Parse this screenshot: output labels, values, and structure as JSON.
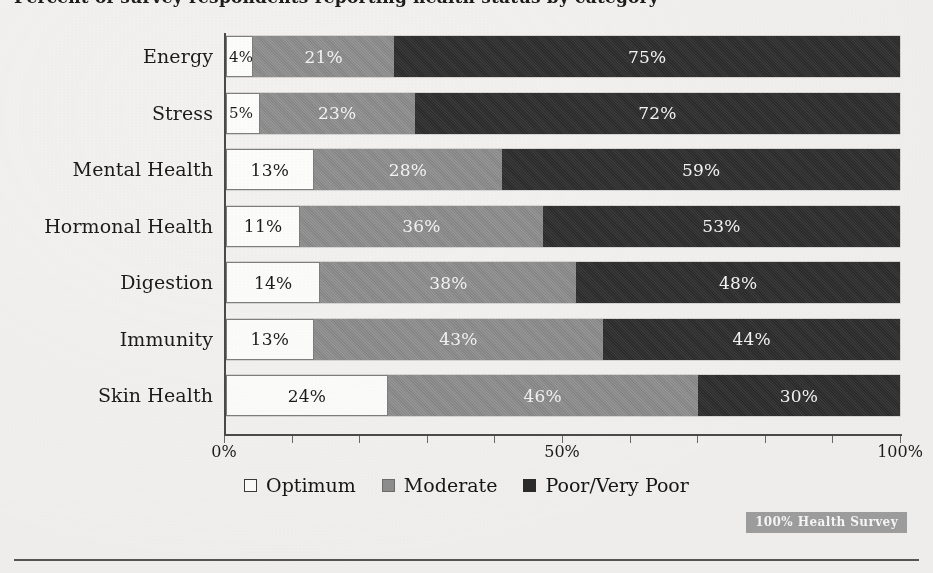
{
  "document": {
    "title_clipped": "Percent of survey respondents reporting health status by category",
    "background_color": "#f3f2f0"
  },
  "chart_data": {
    "type": "bar",
    "orientation": "horizontal",
    "stacked": true,
    "normalized_100": true,
    "title": "",
    "xlabel": "",
    "ylabel": "",
    "xlim": [
      0,
      100
    ],
    "grid": false,
    "legend_position": "bottom",
    "categories": [
      "Energy",
      "Stress",
      "Mental Health",
      "Hormonal Health",
      "Digestion",
      "Immunity",
      "Skin Health"
    ],
    "series": [
      {
        "name": "Optimum",
        "color": "#fdfdfb",
        "values": [
          4,
          5,
          13,
          11,
          14,
          13,
          24
        ],
        "labels": [
          "4%",
          "5%",
          "13%",
          "11%",
          "14%",
          "13%",
          "24%"
        ]
      },
      {
        "name": "Moderate",
        "color": "#8e8e8e",
        "values": [
          21,
          23,
          28,
          36,
          38,
          43,
          46
        ],
        "labels": [
          "21%",
          "23%",
          "28%",
          "36%",
          "38%",
          "43%",
          "46%"
        ]
      },
      {
        "name": "Poor/Very Poor",
        "color": "#2f2f2f",
        "values": [
          75,
          72,
          59,
          53,
          48,
          44,
          30
        ],
        "labels": [
          "75%",
          "72%",
          "59%",
          "53%",
          "48%",
          "44%",
          "30%"
        ]
      }
    ],
    "xticks": [
      0,
      10,
      20,
      30,
      40,
      50,
      60,
      70,
      80,
      90,
      100
    ],
    "xtick_labels": [
      {
        "value": 0,
        "label": "0%"
      },
      {
        "value": 50,
        "label": "50%"
      },
      {
        "value": 100,
        "label": "100%"
      }
    ]
  },
  "legend": {
    "items": [
      {
        "label": "Optimum",
        "swatch": "optimum"
      },
      {
        "label": "Moderate",
        "swatch": "moderate"
      },
      {
        "label": "Poor/Very Poor",
        "swatch": "poor"
      }
    ]
  },
  "watermark": {
    "text": "100% Health Survey"
  }
}
